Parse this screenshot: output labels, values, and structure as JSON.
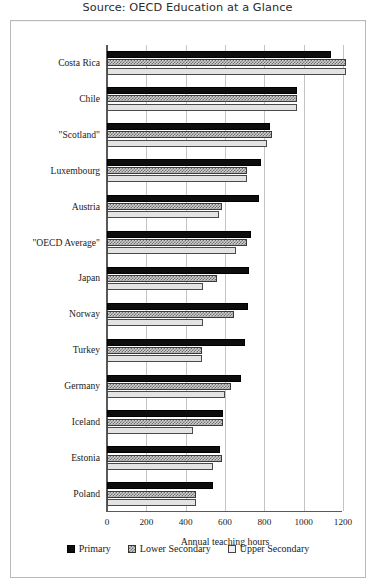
{
  "chart_data": {
    "type": "bar",
    "orientation": "horizontal",
    "title": "Source: OECD Education at a Glance",
    "xlabel": "Annual teaching hours",
    "ylabel": "",
    "xlim": [
      0,
      1300
    ],
    "xticks": [
      0,
      200,
      400,
      600,
      800,
      1000,
      1200
    ],
    "xtick_labels": [
      "0",
      "200",
      "400",
      "600",
      "800",
      "1000",
      "1200"
    ],
    "grid": true,
    "legend_position": "bottom",
    "categories": [
      "Costa Rica",
      "Chile",
      "\"Scotland\"",
      "Luxembourg",
      "Austria",
      "\"OECD Average\"",
      "Japan",
      "Norway",
      "Turkey",
      "Germany",
      "Iceland",
      "Estonia",
      "Poland"
    ],
    "series": [
      {
        "name": "Primary",
        "color": "#0d0d0d",
        "pattern": "solid",
        "values": [
          1140,
          965,
          830,
          785,
          775,
          730,
          720,
          715,
          700,
          680,
          590,
          575,
          540
        ]
      },
      {
        "name": "Lower Secondary",
        "color": "#cfcfcf",
        "pattern": "checkered",
        "values": [
          1215,
          965,
          840,
          710,
          585,
          710,
          560,
          645,
          485,
          630,
          590,
          585,
          450
        ]
      },
      {
        "name": "Upper Secondary",
        "color": "#e3e3e3",
        "pattern": "light",
        "values": [
          1215,
          965,
          815,
          710,
          570,
          655,
          490,
          490,
          485,
          600,
          435,
          540,
          450
        ]
      }
    ]
  },
  "legend": {
    "items": [
      {
        "label": "Primary",
        "swatch": "legend-swatch-primary"
      },
      {
        "label": "Lower Secondary",
        "swatch": "legend-swatch-lower-secondary"
      },
      {
        "label": "Upper Secondary",
        "swatch": "legend-swatch-upper-secondary"
      }
    ]
  }
}
